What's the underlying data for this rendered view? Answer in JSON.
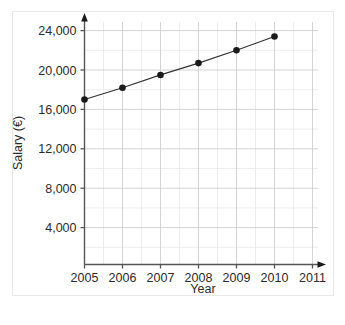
{
  "chart_data": {
    "type": "line",
    "title": "",
    "subtitle": "",
    "xlabel": "Year",
    "ylabel": "Salary (€)",
    "x": [
      2005,
      2006,
      2007,
      2008,
      2009,
      2010
    ],
    "values": [
      17000,
      18200,
      19500,
      20700,
      22000,
      23400
    ],
    "series": [
      {
        "name": "Salary",
        "x": [
          2005,
          2006,
          2007,
          2008,
          2009,
          2010
        ],
        "values": [
          17000,
          18200,
          19500,
          20700,
          22000,
          23400
        ],
        "color": "#1a1a1a",
        "marker": "circle"
      }
    ],
    "xticklabels": [
      "2005",
      "2006",
      "2007",
      "2008",
      "2009",
      "2010",
      "2011"
    ],
    "xtickvalues": [
      2005,
      2006,
      2007,
      2008,
      2009,
      2010,
      2011
    ],
    "yticklabels": [
      "4,000",
      "8,000",
      "12,000",
      "16,000",
      "20,000",
      "24,000"
    ],
    "ytickvalues": [
      4000,
      8000,
      12000,
      16000,
      20000,
      24000
    ],
    "xlim": [
      2004.6,
      2011.4
    ],
    "ylim": [
      0,
      25800
    ],
    "grid": true,
    "grid_major_y_step": 4000,
    "grid_minor_y_step": 2000,
    "grid_major_x_step": 1,
    "grid_minor_x_step": 0.5,
    "legend": null,
    "legend_position": "none",
    "annotations": [],
    "axis_arrows": true,
    "colors": {
      "line": "#333333",
      "marker": "#1a1a1a",
      "axis": "#555555",
      "grid_major": "#cfcfcf",
      "grid_minor": "#e9e9e9",
      "text": "#2b2b2b",
      "frame_border": "#e8e8e8",
      "background": "#ffffff"
    }
  }
}
